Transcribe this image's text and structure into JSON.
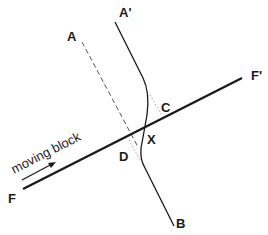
{
  "diagram": {
    "labels": {
      "A": "A",
      "A_prime": "A'",
      "B": "B",
      "C": "C",
      "D": "D",
      "X": "X",
      "F": "F",
      "F_prime": "F'"
    },
    "annotation": "moving block",
    "colors": {
      "line": "#1a1a1a",
      "dashed": "#555555",
      "dotted": "#888888",
      "background": "#ffffff"
    }
  }
}
